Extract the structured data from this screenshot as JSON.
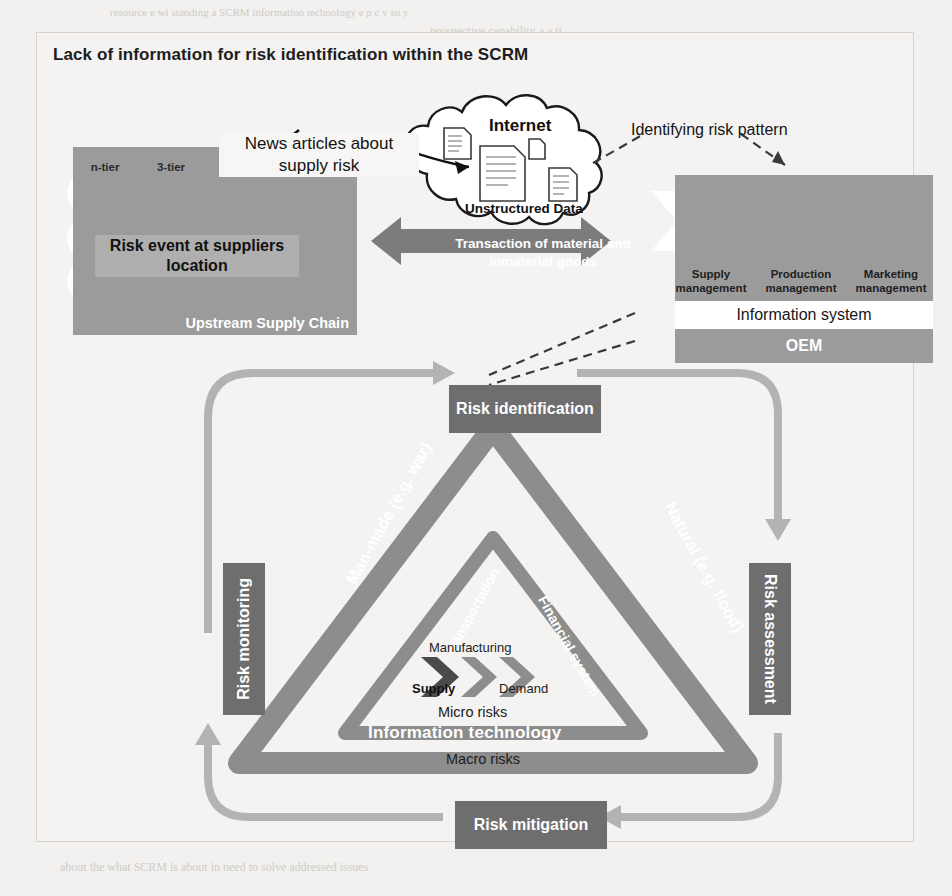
{
  "page": {
    "background_color": "#f2f1ef",
    "bleed_text": [
      {
        "text": "resource            e wi  standing  a SCRM  information  technology  e p   c   v  su  y",
        "x": 110,
        "y": 6,
        "size": 11
      },
      {
        "text": "prospective   capability  a  a  ti",
        "x": 430,
        "y": 24,
        "size": 12
      },
      {
        "text": "and  a    wa        and  commun cation      The   supply   chain     on   a   broad",
        "x": 90,
        "y": 46,
        "size": 12
      },
      {
        "text": "resource",
        "x": 430,
        "y": 66,
        "size": 12
      },
      {
        "text": "capability  and  continuous  communication  of  the  network  partners",
        "x": 180,
        "y": 180,
        "size": 12
      },
      {
        "text": "management   and   risk   ide   fi   ion   pr",
        "x": 220,
        "y": 262,
        "size": 12
      },
      {
        "text": "ntification",
        "x": 640,
        "y": 382,
        "size": 19
      },
      {
        "text": "Suggestion   and   Research   Focus",
        "x": 250,
        "y": 450,
        "size": 17
      },
      {
        "text": "Supply  chain  risk  management  (SCRM)  is  a  process  of  managing  vulnerabilities",
        "x": 60,
        "y": 508,
        "size": 12
      },
      {
        "text": "essential  for  sustaining  profitability  and  continuity  on  the  long  term  in  volatile",
        "x": 60,
        "y": 534,
        "size": 12
      },
      {
        "text": "markets.  It  requires  continuous  internal  and  external  information  exchange  within",
        "x": 60,
        "y": 560,
        "size": 12
      },
      {
        "text": "a  wide  network  of  partners.  This  study  focuses  on  the  IT  supported  risk  assessment",
        "x": 60,
        "y": 586,
        "size": 12
      },
      {
        "text": "exploring  new  knowledge  sources  for  avoiding  costly  supply  chain  disruptions",
        "x": 60,
        "y": 612,
        "size": 12
      },
      {
        "text": "of  SCRM.  Previous  studies  indicate  the  use  of  unstructured  data.  The  relevance",
        "x": 60,
        "y": 638,
        "size": 12
      },
      {
        "text": "of  news  and  social  media  data  is  underlined  in  the  context  of  an  early  detection",
        "x": 60,
        "y": 664,
        "size": 12
      },
      {
        "text": "of  SCM  risk  events.  For  the  SCRM  unfolding  studies  are  necessary  should  clarify",
        "x": 60,
        "y": 690,
        "size": 12
      },
      {
        "text": "usability  of  OEM  in  an  early  stage  of  implementation.  It  is  important  to  describe",
        "x": 60,
        "y": 716,
        "size": 12
      },
      {
        "text": "informational  demand  for  risk  identification  and  assessment  as  well  as  the  impact",
        "x": 60,
        "y": 742,
        "size": 12
      },
      {
        "text": "of  new  knowledge  for  risk  mitigation.  Hence  there  is  now  a  common  understanding",
        "x": 60,
        "y": 768,
        "size": 12
      },
      {
        "text": "about  the  what  SCRM  is  about  in  need  to  solve  addressed  issues",
        "x": 60,
        "y": 860,
        "size": 12
      }
    ]
  },
  "figure": {
    "title": "Lack of information for risk identification within the SCRM",
    "colors": {
      "panel_gray": "#9b9b9b",
      "box_dark_gray": "#6e6e6e",
      "arrow_gray": "#a9a9a9",
      "white": "#ffffff",
      "triangle_outer": "#8d8d8d",
      "triangle_inner": "#8d8d8d"
    },
    "supply_chain": {
      "caption": "Upstream Supply Chain",
      "tiers": [
        "n-tier",
        "3-tier",
        "2-tier",
        "1-tier"
      ],
      "risk_event_label": "Risk event at suppliers location",
      "risk_marker": "x-cross-icon"
    },
    "callouts": {
      "news_articles": "News articles about supply risk",
      "identifying_risk_pattern": "Identifying risk pattern"
    },
    "internet": {
      "label": "Internet",
      "unstructured_label": "Unstructured Data",
      "document_icons": 4
    },
    "transaction_arrow": {
      "label": "Transaction of material and inmaterial goods"
    },
    "oem": {
      "functions": [
        "Supply management",
        "Production management",
        "Marketing management"
      ],
      "information_system": "Information system",
      "oem_label": "OEM"
    },
    "cycle": {
      "identification": "Risk identification",
      "assessment": "Risk assessment",
      "mitigation": "Risk mitigation",
      "monitoring": "Risk monitoring"
    },
    "triangle": {
      "outer_sides": [
        "Man-made (e.g. war)",
        "Natural (e.g. flood)",
        "Information technology"
      ],
      "inner_sides": [
        "Transportation",
        "Financial system"
      ],
      "macro_label": "Macro risks",
      "micro_label": "Micro risks",
      "flow": [
        "Supply",
        "Manufacturing",
        "Demand"
      ]
    }
  }
}
